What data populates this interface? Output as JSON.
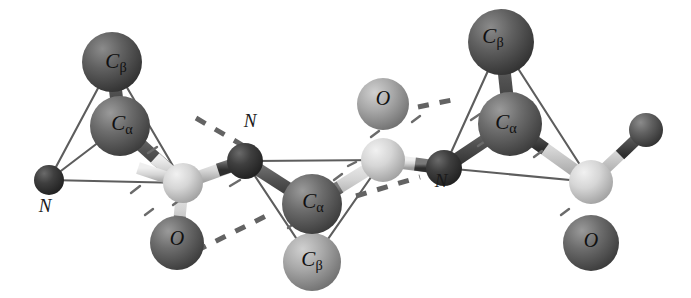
{
  "figure": {
    "kind": "molecular-model",
    "background_color": "#ffffff",
    "width": 691,
    "height": 298
  },
  "palette": {
    "background": "#ffffff",
    "carbon_alpha_dark": "#6e6e6e",
    "carbon_beta_dark": "#636363",
    "carbon_beta_light": "#a9a9a9",
    "oxygen_dark": "#6a6a6a",
    "oxygen_light": "#bdbdbd",
    "nitrogen_dark": "#3c3c3c",
    "carbonyl_carbon_light": "#d2d2d2",
    "bond_thin": "#5a5a5a",
    "bond_light": "#c8c8c8",
    "bond_dark": "#4a4a4a",
    "hbond_dash": "#636363",
    "label_text": "#111111"
  },
  "labels": [
    {
      "id": "cb-left",
      "element": "C",
      "subscript": "β",
      "text": "C",
      "x": 116,
      "y": 63,
      "size": 21,
      "placement": "on-sphere"
    },
    {
      "id": "ca-left",
      "element": "C",
      "subscript": "α",
      "text": "C",
      "x": 122,
      "y": 125,
      "size": 21,
      "placement": "on-sphere"
    },
    {
      "id": "n-left",
      "element": "N",
      "subscript": "",
      "text": "N",
      "x": 45,
      "y": 207,
      "size": 19,
      "placement": "off-sphere"
    },
    {
      "id": "o-left",
      "element": "O",
      "subscript": "",
      "text": "O",
      "x": 177,
      "y": 240,
      "size": 20,
      "placement": "on-sphere"
    },
    {
      "id": "n-mid",
      "element": "N",
      "subscript": "",
      "text": "N",
      "x": 250,
      "y": 122,
      "size": 19,
      "placement": "off-sphere"
    },
    {
      "id": "ca-mid",
      "element": "C",
      "subscript": "α",
      "text": "C",
      "x": 313,
      "y": 203,
      "size": 21,
      "placement": "on-sphere"
    },
    {
      "id": "cb-mid",
      "element": "C",
      "subscript": "β",
      "text": "C",
      "x": 312,
      "y": 261,
      "size": 21,
      "placement": "on-sphere"
    },
    {
      "id": "o-mid",
      "element": "O",
      "subscript": "",
      "text": "O",
      "x": 383,
      "y": 100,
      "size": 20,
      "placement": "on-sphere"
    },
    {
      "id": "n-right",
      "element": "N",
      "subscript": "",
      "text": "N",
      "x": 441,
      "y": 182,
      "size": 19,
      "placement": "off-sphere"
    },
    {
      "id": "cb-right",
      "element": "C",
      "subscript": "β",
      "text": "C",
      "x": 493,
      "y": 38,
      "size": 21,
      "placement": "on-sphere"
    },
    {
      "id": "ca-right",
      "element": "C",
      "subscript": "α",
      "text": "C",
      "x": 506,
      "y": 124,
      "size": 21,
      "placement": "on-sphere"
    },
    {
      "id": "o-right",
      "element": "O",
      "subscript": "",
      "text": "O",
      "x": 591,
      "y": 242,
      "size": 20,
      "placement": "on-sphere"
    }
  ],
  "atoms": [
    {
      "id": "cb-left",
      "label": "C-beta (residue 1)",
      "cx": 112,
      "cy": 62,
      "r": 30,
      "fill": "#636363"
    },
    {
      "id": "ca-left",
      "label": "C-alpha (residue 1)",
      "cx": 120,
      "cy": 126,
      "r": 30,
      "fill": "#6e6e6e"
    },
    {
      "id": "n-left",
      "label": "N (residue 1)",
      "cx": 49,
      "cy": 180,
      "r": 15,
      "fill": "#3c3c3c"
    },
    {
      "id": "c-left",
      "label": "carbonyl C (res 1)",
      "cx": 183,
      "cy": 183,
      "r": 20,
      "fill": "#d2d2d2"
    },
    {
      "id": "o-left",
      "label": "O (residue 1)",
      "cx": 177,
      "cy": 243,
      "r": 27,
      "fill": "#6a6a6a"
    },
    {
      "id": "n-mid",
      "label": "N (residue 2)",
      "cx": 245,
      "cy": 161,
      "r": 18,
      "fill": "#3c3c3c"
    },
    {
      "id": "ca-mid",
      "label": "C-alpha (residue 2)",
      "cx": 312,
      "cy": 204,
      "r": 30,
      "fill": "#6e6e6e"
    },
    {
      "id": "cb-mid",
      "label": "C-beta (residue 2)",
      "cx": 312,
      "cy": 262,
      "r": 29,
      "fill": "#a9a9a9"
    },
    {
      "id": "c-mid",
      "label": "carbonyl C (res 2)",
      "cx": 383,
      "cy": 160,
      "r": 22,
      "fill": "#d2d2d2"
    },
    {
      "id": "o-mid",
      "label": "O (residue 2)",
      "cx": 383,
      "cy": 104,
      "r": 26,
      "fill": "#bdbdbd"
    },
    {
      "id": "n-right",
      "label": "N (residue 3)",
      "cx": 444,
      "cy": 168,
      "r": 18,
      "fill": "#3c3c3c"
    },
    {
      "id": "cb-right",
      "label": "C-beta (residue 3)",
      "cx": 501,
      "cy": 42,
      "r": 33,
      "fill": "#636363"
    },
    {
      "id": "ca-right",
      "label": "C-alpha (residue 3)",
      "cx": 510,
      "cy": 124,
      "r": 32,
      "fill": "#6e6e6e"
    },
    {
      "id": "c-right",
      "label": "carbonyl C (res 3)",
      "cx": 591,
      "cy": 182,
      "r": 22,
      "fill": "#d2d2d2"
    },
    {
      "id": "o-right",
      "label": "O (residue 3)",
      "cx": 591,
      "cy": 243,
      "r": 28,
      "fill": "#6a6a6a"
    },
    {
      "id": "x-right",
      "label": "terminal atom",
      "cx": 646,
      "cy": 130,
      "r": 17,
      "fill": "#636363"
    }
  ],
  "bonds": [
    {
      "id": "cb-ca-left",
      "from": "cb-left",
      "to": "ca-left",
      "style": "thick-dark"
    },
    {
      "id": "ca-n-left",
      "from": "ca-left",
      "to": "n-left",
      "style": "thin"
    },
    {
      "id": "cb-n-left",
      "from": "cb-left",
      "to": "n-left",
      "style": "thin"
    },
    {
      "id": "ca-c-left",
      "from": "ca-left",
      "to": "c-left",
      "style": "thick-light"
    },
    {
      "id": "cb-c-left",
      "from": "cb-left",
      "to": "c-left",
      "style": "thin"
    },
    {
      "id": "n-c-left",
      "from": "n-left",
      "to": "c-left",
      "style": "thin"
    },
    {
      "id": "c-o-left",
      "from": "c-left",
      "to": "o-left",
      "style": "thick-light"
    },
    {
      "id": "c-n-pep1",
      "from": "c-left",
      "to": "n-mid",
      "style": "thick-light"
    },
    {
      "id": "n-ca-mid",
      "from": "n-mid",
      "to": "ca-mid",
      "style": "thick-dark"
    },
    {
      "id": "ca-cb-mid",
      "from": "ca-mid",
      "to": "cb-mid",
      "style": "thick-dark"
    },
    {
      "id": "ca-c-mid",
      "from": "ca-mid",
      "to": "c-mid",
      "style": "thick-light"
    },
    {
      "id": "n-c-mid",
      "from": "n-mid",
      "to": "c-mid",
      "style": "thin"
    },
    {
      "id": "cb-c-mid",
      "from": "cb-mid",
      "to": "c-mid",
      "style": "thin"
    },
    {
      "id": "cb-n-mid",
      "from": "cb-mid",
      "to": "n-mid",
      "style": "thin"
    },
    {
      "id": "c-o-mid",
      "from": "c-mid",
      "to": "o-mid",
      "style": "thick-light"
    },
    {
      "id": "c-n-pep2",
      "from": "c-mid",
      "to": "n-right",
      "style": "thick-light"
    },
    {
      "id": "n-ca-right",
      "from": "n-right",
      "to": "ca-right",
      "style": "thick-dark"
    },
    {
      "id": "ca-cb-right",
      "from": "ca-right",
      "to": "cb-right",
      "style": "thick-dark"
    },
    {
      "id": "cb-n-right",
      "from": "cb-right",
      "to": "n-right",
      "style": "thin"
    },
    {
      "id": "cb-c-right",
      "from": "cb-right",
      "to": "c-right",
      "style": "thin"
    },
    {
      "id": "ca-c-right",
      "from": "ca-right",
      "to": "c-right",
      "style": "thick-light"
    },
    {
      "id": "n-c-right",
      "from": "n-right",
      "to": "c-right",
      "style": "thin"
    },
    {
      "id": "c-o-right",
      "from": "c-right",
      "to": "o-right",
      "style": "thick-light"
    },
    {
      "id": "c-x-right",
      "from": "c-right",
      "to": "x-right",
      "style": "thick-light"
    }
  ],
  "hydrogen_bonds": [
    {
      "id": "hbond-1",
      "x1": 196,
      "y1": 118,
      "x2": 254,
      "y2": 152,
      "note": "upper-left dashed contact"
    },
    {
      "id": "hbond-2",
      "x1": 196,
      "y1": 251,
      "x2": 272,
      "y2": 213,
      "note": "O(res1) to backbone dashed contact"
    },
    {
      "id": "hbond-3",
      "x1": 411,
      "y1": 107,
      "x2": 452,
      "y2": 107,
      "note": "O(res2) dashed contact"
    },
    {
      "id": "hbond-4",
      "x1": 355,
      "y1": 196,
      "x2": 420,
      "y2": 176,
      "note": "lower dashed contact near N(res3)"
    }
  ]
}
